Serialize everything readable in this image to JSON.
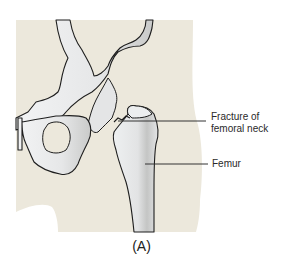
{
  "figure": {
    "caption": "(A)",
    "colors": {
      "background": "#ffffff",
      "skin": "#ece8dc",
      "bone": "#e8e9ea",
      "bone_shadow": "#b7b8b6",
      "outline": "#1e1e1e",
      "leader_line": "#333333"
    },
    "labels": [
      {
        "id": "fracture",
        "text_line1": "Fracture of",
        "text_line2": "femoral neck"
      },
      {
        "id": "femur",
        "text": "Femur"
      }
    ]
  }
}
